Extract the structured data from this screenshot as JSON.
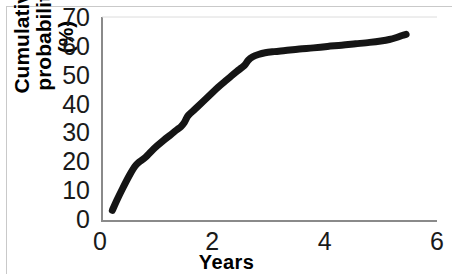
{
  "chart_data": {
    "type": "line",
    "title": "",
    "subtitle": "",
    "xlabel": "Years",
    "ylabel": "Cumulative probability\n(%)",
    "xlim": [
      0,
      6
    ],
    "ylim": [
      0,
      70
    ],
    "xticks": [
      0,
      2,
      4,
      6
    ],
    "xtick_labels": [
      "0",
      "2",
      "4",
      "6"
    ],
    "yticks": [
      0,
      10,
      20,
      30,
      40,
      50,
      60,
      70
    ],
    "ytick_labels": [
      "0",
      "10",
      "20",
      "30",
      "40",
      "50",
      "60",
      "70"
    ],
    "grid": false,
    "legend": false,
    "legend_position": "none",
    "line_color": "#151515",
    "line_width": 7,
    "axis_color": "#7a7a7a",
    "series": [
      {
        "name": "Cumulative probability",
        "x": [
          0.22,
          0.3,
          0.4,
          0.52,
          0.62,
          0.7,
          0.76,
          0.82,
          0.92,
          1.02,
          1.14,
          1.26,
          1.36,
          1.44,
          1.5,
          1.56,
          1.62,
          1.72,
          1.84,
          1.98,
          2.1,
          2.22,
          2.34,
          2.44,
          2.52,
          2.58,
          2.64,
          2.72,
          2.82,
          2.94,
          3.1,
          3.3,
          3.55,
          3.8,
          4.05,
          4.3,
          4.55,
          4.8,
          5.0,
          5.15,
          5.28,
          5.38,
          5.45
        ],
        "y": [
          3.0,
          6.5,
          10.5,
          15.0,
          18.2,
          19.8,
          20.6,
          21.6,
          23.6,
          25.4,
          27.4,
          29.2,
          30.8,
          32.0,
          33.4,
          35.6,
          36.8,
          38.6,
          40.8,
          43.4,
          45.6,
          47.6,
          49.6,
          51.2,
          52.4,
          53.4,
          55.0,
          56.2,
          57.0,
          57.6,
          58.0,
          58.4,
          58.9,
          59.3,
          59.8,
          60.2,
          60.7,
          61.2,
          61.7,
          62.2,
          62.9,
          63.6,
          64.0
        ]
      }
    ],
    "annotations": []
  },
  "axes": {
    "y_title": "Cumulative probability\n(%)",
    "x_title": "Years"
  }
}
